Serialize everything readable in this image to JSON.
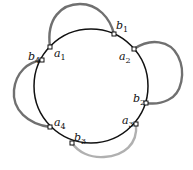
{
  "diagram": {
    "circle": {
      "cx": 91,
      "cy": 86,
      "r": 57,
      "stroke": "#111111"
    },
    "points": [
      {
        "id": "a1",
        "letter": "a",
        "sub": "1",
        "x": 50,
        "y": 47,
        "lx": 54,
        "ly": 57
      },
      {
        "id": "b1",
        "letter": "b",
        "sub": "1",
        "x": 114,
        "y": 34,
        "lx": 116,
        "ly": 29
      },
      {
        "id": "a2",
        "letter": "a",
        "sub": "2",
        "x": 134,
        "y": 49,
        "lx": 119,
        "ly": 60
      },
      {
        "id": "b2",
        "letter": "b",
        "sub": "2",
        "x": 146,
        "y": 103,
        "lx": 133,
        "ly": 102
      },
      {
        "id": "a3",
        "letter": "a",
        "sub": "3",
        "x": 136,
        "y": 124,
        "lx": 122,
        "ly": 124
      },
      {
        "id": "b3",
        "letter": "b",
        "sub": "3",
        "x": 72,
        "y": 143,
        "lx": 74,
        "ly": 141
      },
      {
        "id": "a4",
        "letter": "a",
        "sub": "4",
        "x": 50,
        "y": 127,
        "lx": 54,
        "ly": 126
      },
      {
        "id": "b4",
        "letter": "b",
        "sub": "4",
        "x": 42,
        "y": 60,
        "lx": 28,
        "ly": 60
      }
    ],
    "arcs": [
      {
        "from": "a1",
        "to": "b1",
        "color": "#707070"
      },
      {
        "from": "a2",
        "to": "b2",
        "color": "#707070"
      },
      {
        "from": "b4",
        "to": "a4",
        "color": "#707070"
      },
      {
        "from": "a3",
        "to": "b3",
        "color": "#b0b0b0"
      }
    ]
  }
}
